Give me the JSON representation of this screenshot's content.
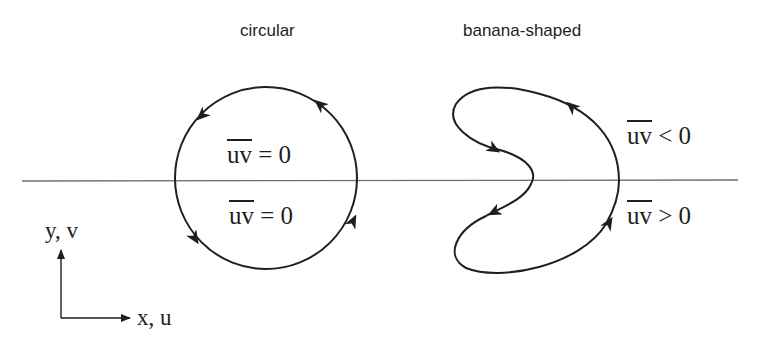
{
  "titles": {
    "circular": "circular",
    "banana": "banana-shaped"
  },
  "circular": {
    "upper_label": {
      "overlined": "uv",
      "rest": " = 0"
    },
    "lower_label": {
      "overlined": "uv",
      "rest": " = 0"
    }
  },
  "banana": {
    "upper_label": {
      "overlined": "uv",
      "rest": " < 0"
    },
    "lower_label": {
      "overlined": "uv",
      "rest": " > 0"
    }
  },
  "axes": {
    "y_label": "y, v",
    "x_label": "x, u"
  },
  "colors": {
    "stroke": "#1e1e1e",
    "baseline": "#6e6e6e",
    "background": "#ffffff"
  }
}
